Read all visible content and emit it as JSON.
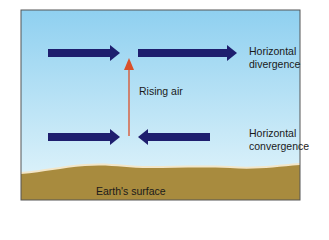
{
  "labels": {
    "rising_air": "Rising air",
    "divergence": [
      "Horizontal",
      "divergence"
    ],
    "convergence": [
      "Horizontal",
      "convergence"
    ],
    "surface": "Earth's surface"
  },
  "colors": {
    "sky_top": "#8fd0f0",
    "sky_bottom": "#e6f6fb",
    "ground": "#a88b3e",
    "ground_edge": "#f3e6c8",
    "arrow_blue": "#1e1e6e",
    "arrow_red": "#d9502a",
    "frame": "#555555"
  }
}
